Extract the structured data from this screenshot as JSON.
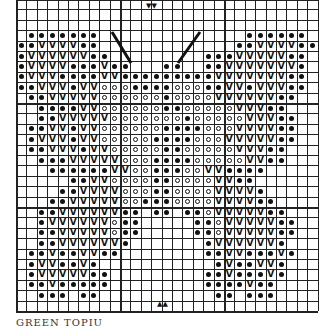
{
  "caption": "GREEN TOPIU",
  "grid": {
    "cols": 29,
    "rows": 30,
    "cell_px": 10.4
  },
  "legend_symbols": {
    "d": "dot",
    "v": "V",
    "o": "ring",
    ".": "empty"
  },
  "markers": {
    "top": "▼▼",
    "bottom": "▲▲"
  },
  "rows": [
    ".............................",
    ".............................",
    ".............................",
    ".ddddddd..............dddddd.",
    "ddvvvvdd.............ddvvvvdd",
    "dvvvvvvdd.........dddvvvvvdd",
    "dvvvvdddvdd...dd..ddvvvvvvvd",
    "dvvvddddvvdddddddddvvvvvvvdd",
    "ddvvvdvvoooddddoooddvvdvvvdd",
    ".ddvvvvvoooooodoooovvvvvvdd.",
    "..ddddvvooooooddooooovvvdd..",
    "..ddvvvvvooooooodooooovvvdd.",
    ".ddvvdvvooooooddddooovvvvdd.",
    ".dvvvdvvoooooddddooovvvvvdd.",
    ".ddvvvdvvoooooddooooovvvdd..",
    "..dddvvvvvoooddddooooovvdd..",
    "...ddddddvvoodddoovvdddd....",
    ".....ddvvooooddoooovvdd.....",
    "....ddvvvvoooddoooovvvvd....",
    "...ddvvvvvoodddoooovvvvdd...",
    "..ddvvvvvvdd.dd.ddovvvvvdd..",
    "..dvvvvvvodd.....ddovvvvvdd.",
    "..ddvvvvvodd.....ddovvvvvdd.",
    "..ddvvvvvvd.......dvvvvvvd..",
    ".ddvddvvdd........ddvvdddvd.",
    ".dvvddvd...........dvddvvd..",
    ".dvvvvvdd.........ddvdddvd..",
    ".ddvddddd.........ddddvdd...",
    "..ddd.dd...........dd.ddd...",
    "............................."
  ],
  "antennae": [
    {
      "from": [
        112,
        32
      ],
      "to": [
        131,
        63
      ]
    },
    {
      "from": [
        200,
        32
      ],
      "to": [
        178,
        63
      ]
    }
  ]
}
